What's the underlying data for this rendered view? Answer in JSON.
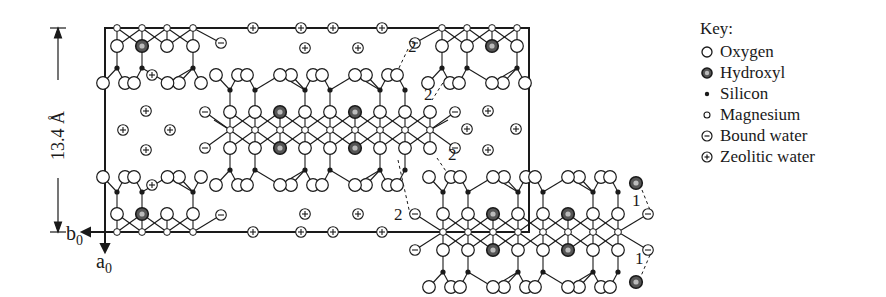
{
  "figure": {
    "dimension_label": "13.4 Å",
    "axis_b": "b",
    "axis_b_sub": "0",
    "axis_a": "a",
    "axis_a_sub": "0",
    "bond_labels_2": [
      "2",
      "2",
      "2",
      "2"
    ],
    "bond_labels_1": [
      "1",
      "1"
    ]
  },
  "key": {
    "title": "Key:",
    "items": [
      {
        "symbol": "open-circle",
        "label": "Oxygen"
      },
      {
        "symbol": "double-ring-circle",
        "label": "Hydroxyl"
      },
      {
        "symbol": "small-filled-dot",
        "label": "Silicon"
      },
      {
        "symbol": "small-open-circle",
        "label": "Magnesium"
      },
      {
        "symbol": "circle-minus",
        "label": "Bound water"
      },
      {
        "symbol": "circle-plus",
        "label": "Zeolitic water"
      }
    ]
  },
  "colors": {
    "ink": "#1a1a1a",
    "background": "#ffffff"
  }
}
